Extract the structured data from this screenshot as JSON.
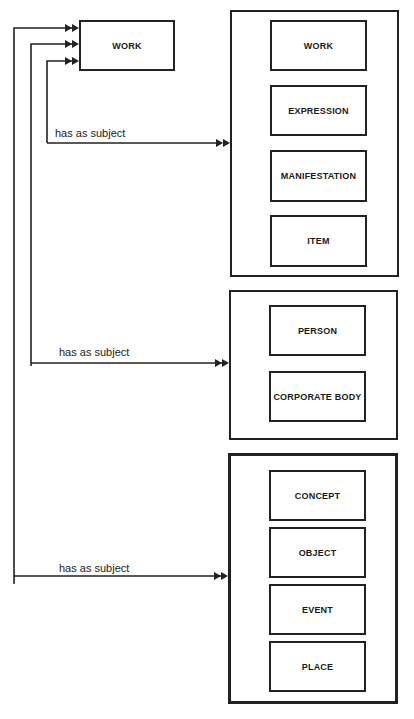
{
  "diagram": {
    "source_entity": "WORK",
    "relationships": [
      {
        "label": "has as subject",
        "target_group": "group1"
      },
      {
        "label": "has as subject",
        "target_group": "group2"
      },
      {
        "label": "has as subject",
        "target_group": "group3"
      }
    ],
    "groups": {
      "group1": {
        "entities": [
          "WORK",
          "EXPRESSION",
          "MANIFESTATION",
          "ITEM"
        ]
      },
      "group2": {
        "entities": [
          "PERSON",
          "CORPORATE BODY"
        ]
      },
      "group3": {
        "entities": [
          "CONCEPT",
          "OBJECT",
          "EVENT",
          "PLACE"
        ]
      }
    },
    "colors": {
      "line": "#222222",
      "background": "#ffffff"
    }
  }
}
